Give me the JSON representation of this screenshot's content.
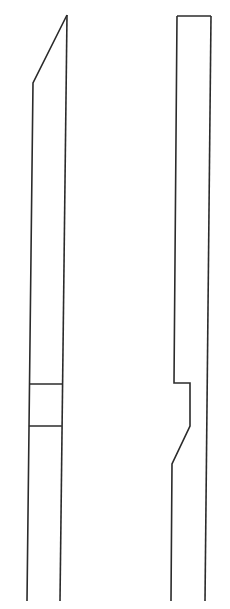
{
  "figure": {
    "type": "line-drawing",
    "background": "#ffffff",
    "stroke_color": "#2b2b2b",
    "parts": [
      {
        "name": "left-strip",
        "outline": [
          [
            67,
            15
          ],
          [
            33,
            83
          ],
          [
            27,
            601
          ]
        ],
        "outline_right": [
          [
            67,
            15
          ],
          [
            60,
            601
          ]
        ],
        "cross_lines_y": [
          384,
          426
        ]
      },
      {
        "name": "right-strip",
        "outline_left": [
          [
            177,
            16
          ],
          [
            174,
            383
          ],
          [
            190,
            383
          ],
          [
            190,
            426
          ],
          [
            172,
            464
          ],
          [
            171,
            601
          ]
        ],
        "outline_right": [
          [
            211,
            16
          ],
          [
            205,
            601
          ]
        ],
        "top_cap": [
          [
            177,
            16
          ],
          [
            211,
            16
          ]
        ]
      }
    ]
  }
}
